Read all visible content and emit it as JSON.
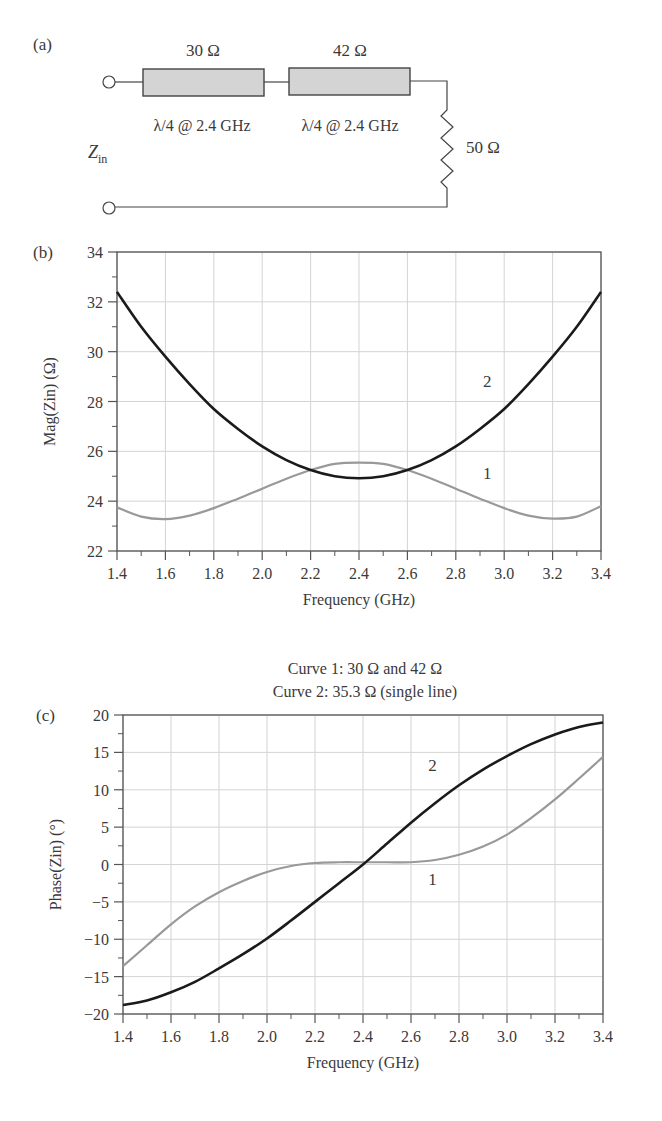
{
  "panel_a": {
    "label": "(a)",
    "line1": {
      "impedance": "30 Ω",
      "length": "λ/4 @ 2.4 GHz"
    },
    "line2": {
      "impedance": "42 Ω",
      "length": "λ/4 @ 2.4 GHz"
    },
    "load": "50 Ω",
    "zin_main": "Z",
    "zin_sub": "in"
  },
  "caption": {
    "line1": "Curve 1: 30 Ω and 42 Ω",
    "line2": "Curve 2: 35.3 Ω (single line)"
  },
  "colors": {
    "curve1": "#999999",
    "curve2": "#1a1a1a",
    "grid": "#d4d4d4",
    "axis": "#555555"
  },
  "chart_data": [
    {
      "panel": "(b)",
      "type": "line",
      "title": "",
      "xlabel": "Frequency (GHz)",
      "ylabel": "Mag(Zin) (Ω)",
      "xlim": [
        1.4,
        3.4
      ],
      "ylim": [
        22,
        34
      ],
      "grid": true,
      "xticks": [
        "1.4",
        "1.6",
        "1.8",
        "2.0",
        "2.2",
        "2.4",
        "2.6",
        "2.8",
        "3.0",
        "3.2",
        "3.4"
      ],
      "yticks": [
        "22",
        "24",
        "26",
        "28",
        "30",
        "32",
        "34"
      ],
      "x": [
        1.4,
        1.5,
        1.6,
        1.7,
        1.8,
        1.9,
        2.0,
        2.1,
        2.2,
        2.3,
        2.4,
        2.5,
        2.6,
        2.7,
        2.8,
        2.9,
        3.0,
        3.1,
        3.2,
        3.3,
        3.4
      ],
      "series": [
        {
          "name": "1",
          "label_pos": [
            2.93,
            24.9
          ],
          "values": [
            23.75,
            23.38,
            23.28,
            23.42,
            23.72,
            24.1,
            24.5,
            24.9,
            25.25,
            25.5,
            25.55,
            25.5,
            25.25,
            24.9,
            24.5,
            24.1,
            23.72,
            23.42,
            23.3,
            23.38,
            23.8
          ]
        },
        {
          "name": "2",
          "label_pos": [
            2.93,
            28.6
          ],
          "values": [
            32.4,
            31.0,
            29.8,
            28.7,
            27.7,
            26.9,
            26.2,
            25.65,
            25.25,
            25.0,
            24.92,
            25.0,
            25.25,
            25.65,
            26.2,
            26.9,
            27.7,
            28.7,
            29.8,
            31.0,
            32.4
          ]
        }
      ]
    },
    {
      "panel": "(c)",
      "type": "line",
      "title": "Curve 1: 30 Ω and 42 Ω / Curve 2: 35.3 Ω (single line)",
      "xlabel": "Frequency (GHz)",
      "ylabel": "Phase(Zin) (°)",
      "xlim": [
        1.4,
        3.4
      ],
      "ylim": [
        -20,
        20
      ],
      "grid": true,
      "xticks": [
        "1.4",
        "1.6",
        "1.8",
        "2.0",
        "2.2",
        "2.4",
        "2.6",
        "2.8",
        "3.0",
        "3.2",
        "3.4"
      ],
      "yticks": [
        "-20",
        "-15",
        "-10",
        "-5",
        "0",
        "5",
        "10",
        "15",
        "20"
      ],
      "x": [
        1.4,
        1.5,
        1.6,
        1.7,
        1.8,
        1.9,
        2.0,
        2.1,
        2.2,
        2.3,
        2.4,
        2.5,
        2.6,
        2.7,
        2.8,
        2.9,
        3.0,
        3.1,
        3.2,
        3.3,
        3.4
      ],
      "series": [
        {
          "name": "1",
          "label_pos": [
            2.69,
            -2.8
          ],
          "values": [
            -13.6,
            -10.8,
            -8.0,
            -5.6,
            -3.7,
            -2.2,
            -1.0,
            -0.2,
            0.2,
            0.3,
            0.3,
            0.3,
            0.3,
            0.6,
            1.3,
            2.4,
            4.0,
            6.2,
            8.7,
            11.5,
            14.4
          ]
        },
        {
          "name": "2",
          "label_pos": [
            2.69,
            12.5
          ],
          "values": [
            -18.8,
            -18.2,
            -17.1,
            -15.7,
            -13.9,
            -12.0,
            -9.9,
            -7.5,
            -5.0,
            -2.5,
            0.0,
            2.8,
            5.6,
            8.2,
            10.6,
            12.7,
            14.5,
            16.1,
            17.4,
            18.4,
            19.0
          ]
        }
      ]
    }
  ]
}
